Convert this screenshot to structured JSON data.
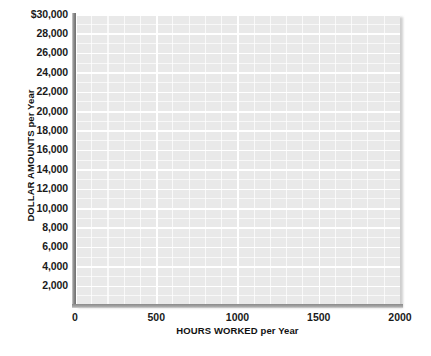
{
  "chart_data": {
    "type": "line",
    "title": "",
    "subtitle": "",
    "xlabel_main": "HOURS WORKED",
    "xlabel_unit": "per Year",
    "xlabel": "HOURS WORKED per Year",
    "ylabel_main": "DOLLAR AMOUNTS",
    "ylabel_unit": "per Year",
    "ylabel": "DOLLAR AMOUNTS per Year",
    "xlim": [
      0,
      2000
    ],
    "ylim": [
      0,
      30000
    ],
    "x_ticks": [
      "0",
      "500",
      "1000",
      "1500",
      "2000"
    ],
    "x_tick_values": [
      0,
      500,
      1000,
      1500,
      2000
    ],
    "y_ticks": [
      "$30,000",
      "28,000",
      "26,000",
      "24,000",
      "22,000",
      "20,000",
      "18,000",
      "16,000",
      "14,000",
      "12,000",
      "10,000",
      "8,000",
      "6,000",
      "4,000",
      "2,000"
    ],
    "y_tick_values": [
      30000,
      28000,
      26000,
      24000,
      22000,
      20000,
      18000,
      16000,
      14000,
      12000,
      10000,
      8000,
      6000,
      4000,
      2000
    ],
    "grid": true,
    "grid_major_x_step": 500,
    "grid_minor_x_step": 100,
    "grid_major_y_step": 2000,
    "grid_minor_y_step": 1000,
    "legend": [],
    "legend_position": "none",
    "series": [],
    "annotations": [],
    "plot_background_color": "#e9e9e9",
    "gridline_color": "#ffffff",
    "axis_line_color": "#8a8a8a",
    "text_color": "#1a1a1a",
    "page_background_color": "#ffffff"
  }
}
